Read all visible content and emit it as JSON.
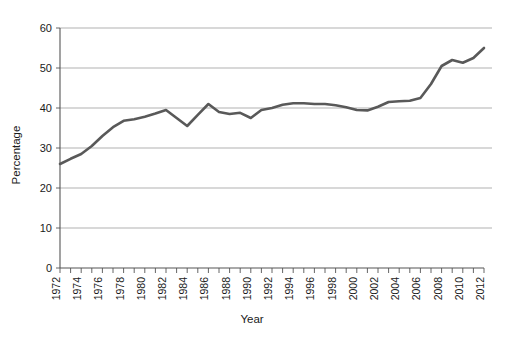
{
  "chart_data": {
    "type": "line",
    "title": "",
    "xlabel": "Year",
    "ylabel": "Percentage",
    "xlim": [
      1972,
      2012
    ],
    "ylim": [
      0,
      60
    ],
    "grid": true,
    "legend": "none",
    "y_ticks": [
      0,
      10,
      20,
      30,
      40,
      50,
      60
    ],
    "x_tick_labels": [
      "1972",
      "1974",
      "1976",
      "1978",
      "1980",
      "1982",
      "1984",
      "1986",
      "1988",
      "1990",
      "1992",
      "1994",
      "1996",
      "1998",
      "2000",
      "2002",
      "2004",
      "2006",
      "2008",
      "2010",
      "2012"
    ],
    "x_minor_step": 1,
    "series": [
      {
        "name": "Percentage",
        "color": "#595959",
        "x": [
          1972,
          1973,
          1974,
          1975,
          1976,
          1977,
          1978,
          1979,
          1980,
          1981,
          1982,
          1983,
          1984,
          1985,
          1986,
          1987,
          1988,
          1989,
          1990,
          1991,
          1992,
          1993,
          1994,
          1995,
          1996,
          1997,
          1998,
          1999,
          2000,
          2001,
          2002,
          2003,
          2004,
          2005,
          2006,
          2007,
          2008,
          2009,
          2010,
          2011,
          2012
        ],
        "values": [
          26.0,
          27.3,
          28.5,
          30.5,
          33.0,
          35.2,
          36.8,
          37.2,
          37.8,
          38.6,
          39.5,
          37.5,
          35.5,
          38.3,
          41.0,
          39.0,
          38.5,
          38.8,
          37.5,
          39.5,
          40.0,
          40.8,
          41.2,
          41.2,
          41.0,
          41.0,
          40.7,
          40.2,
          39.5,
          39.4,
          40.3,
          41.5,
          41.7,
          41.8,
          42.5,
          46.0,
          50.5,
          52.0,
          51.3,
          52.5,
          55.0
        ]
      }
    ]
  },
  "axes": {
    "y_title": "Percentage",
    "x_title": "Year"
  }
}
